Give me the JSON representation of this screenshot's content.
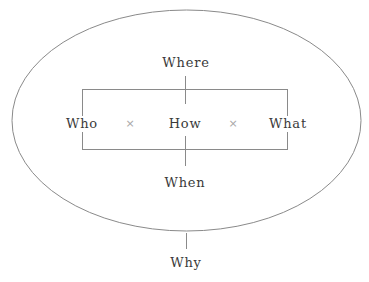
{
  "diagram": {
    "outer": {
      "shape": "ellipse",
      "label": "Why"
    },
    "inner": {
      "shape": "rectangle"
    },
    "labels": {
      "top": "Where",
      "left": "Who",
      "center": "How",
      "right": "What",
      "bottom": "When",
      "outside": "Why"
    },
    "operators": [
      "×",
      "×"
    ],
    "colors": {
      "line": "#8a8a8a",
      "text": "#3a3a3a",
      "operator": "#a8a8a8",
      "background": "#ffffff"
    }
  }
}
